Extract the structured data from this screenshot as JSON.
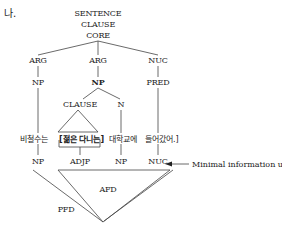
{
  "marker": "나.",
  "tree": {
    "root": [
      "SENTENCE",
      "CLAUSE",
      "CORE"
    ],
    "core_children": [
      "ARG",
      "ARG",
      "NUC"
    ],
    "level2": [
      "NP",
      "NP",
      "PRED"
    ],
    "np_children": [
      "CLAUSE",
      "N"
    ]
  },
  "words": {
    "w1": "비철수는",
    "w2": "[젊은 다니는]",
    "w3": "대학교에",
    "w4": "들어갔어.]"
  },
  "bottom_labels": [
    "NP",
    "ADJP",
    "NP",
    "NUC"
  ],
  "annotation": "Minimal information unit",
  "regions": {
    "inner": "AFD",
    "outer": "PFD"
  }
}
